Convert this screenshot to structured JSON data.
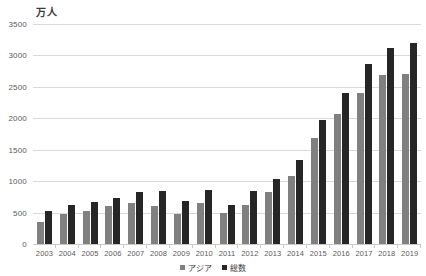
{
  "chart_data": {
    "type": "bar",
    "title": "",
    "unit_label": "万人",
    "xlabel": "",
    "ylabel": "",
    "ylim": [
      0,
      3500
    ],
    "ytick_step": 500,
    "yticks": [
      "3500",
      "3000",
      "2500",
      "2000",
      "1500",
      "1000",
      "500",
      "0"
    ],
    "grid": true,
    "legend_position": "bottom",
    "categories": [
      "2003",
      "2004",
      "2005",
      "2006",
      "2007",
      "2008",
      "2009",
      "2010",
      "2011",
      "2012",
      "2013",
      "2014",
      "2015",
      "2016",
      "2017",
      "2018",
      "2019"
    ],
    "series": [
      {
        "name": "アジア",
        "color": "#808080",
        "values": [
          350,
          480,
          520,
          600,
          660,
          600,
          480,
          650,
          490,
          620,
          830,
          1090,
          1690,
          2070,
          2400,
          2690,
          2700
        ]
      },
      {
        "name": "総数",
        "color": "#262626",
        "values": [
          520,
          620,
          670,
          730,
          830,
          840,
          680,
          860,
          620,
          840,
          1040,
          1340,
          1970,
          2400,
          2870,
          3120,
          3200
        ]
      }
    ]
  }
}
